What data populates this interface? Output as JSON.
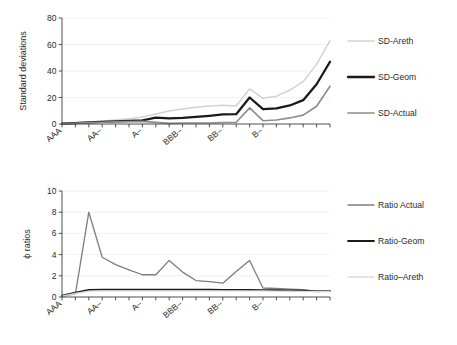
{
  "figure": {
    "title": "",
    "panels": [
      "standard-deviations",
      "phi-ratios"
    ]
  },
  "chart_data": [
    {
      "type": "line",
      "title": "",
      "xlabel": "",
      "ylabel": "Standard deviations",
      "ylim": [
        0,
        80
      ],
      "yticks": [
        0,
        20,
        40,
        60,
        80
      ],
      "ytick_labels": [
        "0",
        "20",
        "40",
        "60",
        "80"
      ],
      "grid": true,
      "grid_axis": "y",
      "legend_position": "right",
      "x": [
        1,
        2,
        3,
        4,
        5,
        6,
        7,
        8,
        9,
        10,
        11,
        12,
        13,
        14,
        15,
        16,
        17,
        18,
        19,
        20,
        21
      ],
      "categories": [
        "AAA",
        "AA+",
        "AA",
        "AA-",
        "A+",
        "A",
        "A-",
        "BBB+",
        "BBB",
        "BBB-",
        "BB+",
        "BB",
        "BB-",
        "B+",
        "B",
        "B-",
        "CCC+",
        "CCC",
        "CCC-",
        "CC",
        "C"
      ],
      "xtick_labels": [
        "AAA",
        "",
        "",
        "AA–",
        "",
        "",
        "A–",
        "",
        "",
        "BBB–",
        "",
        "",
        "BB–",
        "",
        "",
        "B–",
        "",
        "",
        "",
        "",
        ""
      ],
      "series": [
        {
          "name": "SD-Areth",
          "color": "#d2d2d2",
          "width": 1.5,
          "values": [
            0.3,
            0.9,
            1.6,
            2.2,
            3.0,
            4.0,
            5.2,
            7.6,
            9.8,
            11.4,
            12.6,
            13.6,
            14.2,
            13.6,
            26.5,
            19.4,
            21.0,
            25.5,
            32.0,
            45.0,
            63.0
          ]
        },
        {
          "name": "SD-Geom",
          "color": "#1a1a1a",
          "width": 2.3,
          "values": [
            0.2,
            0.7,
            1.2,
            1.6,
            2.0,
            2.4,
            2.8,
            4.8,
            4.2,
            4.6,
            5.4,
            6.2,
            7.2,
            7.4,
            20.0,
            11.2,
            11.8,
            14.0,
            18.0,
            30.0,
            47.0
          ]
        },
        {
          "name": "SD-Actual",
          "color": "#8c8c8c",
          "width": 1.6,
          "values": [
            0.1,
            0.5,
            1.0,
            1.3,
            1.6,
            1.8,
            2.0,
            1.2,
            0.5,
            0.7,
            0.7,
            0.8,
            1.1,
            1.3,
            12.2,
            2.5,
            3.0,
            4.6,
            6.7,
            13.4,
            28.5
          ]
        }
      ]
    },
    {
      "type": "line",
      "title": "",
      "xlabel": "",
      "ylabel": "ϕ ratios",
      "ylim": [
        0,
        10
      ],
      "yticks": [
        0,
        2,
        4,
        6,
        8,
        10
      ],
      "ytick_labels": [
        "0",
        "2",
        "4",
        "6",
        "8",
        "10"
      ],
      "grid": true,
      "grid_axis": "y",
      "legend_position": "right",
      "x": [
        1,
        2,
        3,
        4,
        5,
        6,
        7,
        8,
        9,
        10,
        11,
        12,
        13,
        14,
        15,
        16,
        17,
        18,
        19,
        20,
        21
      ],
      "categories": [
        "AAA",
        "AA+",
        "AA",
        "AA-",
        "A+",
        "A",
        "A-",
        "BBB+",
        "BBB",
        "BBB-",
        "BB+",
        "BB",
        "BB-",
        "B+",
        "B",
        "B-",
        "CCC+",
        "CCC",
        "CCC-",
        "CC",
        "C"
      ],
      "xtick_labels": [
        "AAA",
        "",
        "",
        "AA–",
        "",
        "",
        "A–",
        "",
        "",
        "BBB–",
        "",
        "",
        "BB–",
        "",
        "",
        "B–",
        "",
        "",
        "",
        "",
        ""
      ],
      "series": [
        {
          "name": "Ratio Actual",
          "color": "#7d7d7d",
          "width": 1.3,
          "values": [
            0.05,
            0.3,
            8.0,
            3.75,
            3.05,
            2.55,
            2.1,
            2.1,
            3.45,
            2.35,
            1.55,
            1.45,
            1.3,
            2.4,
            3.45,
            0.85,
            0.8,
            0.75,
            0.7,
            0.52,
            0.55
          ]
        },
        {
          "name": "Ratio-Geom",
          "color": "#1a1a1a",
          "width": 1.8,
          "values": [
            0.12,
            0.42,
            0.68,
            0.7,
            0.7,
            0.7,
            0.7,
            0.7,
            0.7,
            0.7,
            0.7,
            0.69,
            0.68,
            0.67,
            0.66,
            0.65,
            0.64,
            0.62,
            0.6,
            0.56,
            0.55
          ]
        },
        {
          "name": "Ratio–Areth",
          "color": "#dadada",
          "width": 1.3,
          "values": [
            0.08,
            0.33,
            0.56,
            0.57,
            0.57,
            0.57,
            0.57,
            0.57,
            0.57,
            0.57,
            0.57,
            0.57,
            0.57,
            0.57,
            0.57,
            0.57,
            0.56,
            0.55,
            0.54,
            0.52,
            0.52
          ]
        }
      ]
    }
  ],
  "panel_top": {
    "ylabel": "Standard deviations",
    "ytick_labels": [
      "80",
      "60",
      "40",
      "20",
      "0"
    ],
    "xtick_labels": [
      "AAA",
      "AA–",
      "A–",
      "BBB–",
      "BB–",
      "B–"
    ],
    "legend": [
      {
        "label": "SD-Areth"
      },
      {
        "label": "SD-Geom"
      },
      {
        "label": "SD-Actual"
      }
    ]
  },
  "panel_bottom": {
    "ylabel": "ϕ ratios",
    "ytick_labels": [
      "10",
      "8",
      "6",
      "4",
      "2",
      "0"
    ],
    "xtick_labels": [
      "AAA",
      "AA–",
      "A–",
      "BBB–",
      "BB–",
      "B–"
    ],
    "legend": [
      {
        "label": "Ratio Actual"
      },
      {
        "label": "Ratio-Geom"
      },
      {
        "label": "Ratio–Areth"
      }
    ]
  }
}
